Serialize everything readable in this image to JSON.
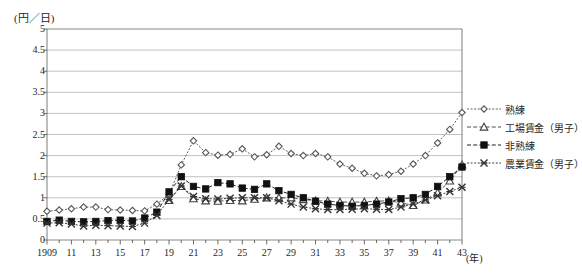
{
  "chart_data": {
    "type": "line",
    "title": "",
    "subtitle": "",
    "ylabel": "(円／日)",
    "xlabel": "(年)",
    "ylim": [
      0,
      5
    ],
    "ytick_step": 0.5,
    "yticks": [
      "0",
      "0.5",
      "1",
      "1.5",
      "2",
      "2.5",
      "3",
      "3.5",
      "4",
      "4.5",
      "5"
    ],
    "xlim": [
      1909,
      1943
    ],
    "xticks": [
      "1909",
      "11",
      "13",
      "15",
      "17",
      "19",
      "21",
      "23",
      "25",
      "27",
      "29",
      "31",
      "33",
      "35",
      "37",
      "39",
      "41",
      "43"
    ],
    "x": [
      1909,
      1910,
      1911,
      1912,
      1913,
      1914,
      1915,
      1916,
      1917,
      1918,
      1919,
      1920,
      1921,
      1922,
      1923,
      1924,
      1925,
      1926,
      1927,
      1928,
      1929,
      1930,
      1931,
      1932,
      1933,
      1934,
      1935,
      1936,
      1937,
      1938,
      1939,
      1940,
      1941,
      1942,
      1943
    ],
    "grid": true,
    "legend_position": "right",
    "series": [
      {
        "name": "熟練",
        "marker": "diamond",
        "linestyle": "dotted",
        "color": "#555555",
        "values": [
          0.68,
          0.71,
          0.74,
          0.78,
          0.78,
          0.72,
          0.71,
          0.7,
          0.69,
          0.85,
          1.08,
          1.78,
          2.35,
          2.07,
          2.01,
          2.03,
          2.16,
          1.97,
          2.02,
          2.22,
          2.05,
          2.0,
          2.05,
          1.97,
          1.8,
          1.7,
          1.58,
          1.52,
          1.55,
          1.63,
          1.8,
          2.0,
          2.3,
          2.62,
          3.02
        ]
      },
      {
        "name": "工場賃金（男子）",
        "marker": "triangle",
        "linestyle": "dashed",
        "color": "#444444",
        "values": [
          null,
          null,
          null,
          null,
          null,
          null,
          null,
          null,
          null,
          null,
          0.94,
          1.27,
          0.98,
          0.93,
          0.92,
          0.94,
          0.93,
          0.97,
          1.0,
          1.0,
          1.0,
          0.96,
          0.93,
          0.92,
          0.9,
          0.9,
          0.9,
          0.92,
          0.93,
          0.88,
          0.82,
          0.95,
          1.12,
          1.4,
          1.78
        ]
      },
      {
        "name": "非熟練",
        "marker": "square",
        "linestyle": "dashed",
        "color": "#111111",
        "values": [
          0.44,
          0.47,
          0.44,
          0.43,
          0.44,
          0.46,
          0.47,
          0.45,
          0.52,
          0.66,
          1.14,
          1.5,
          1.27,
          1.21,
          1.36,
          1.33,
          1.23,
          1.2,
          1.33,
          1.17,
          1.08,
          1.0,
          0.92,
          0.85,
          0.82,
          0.8,
          0.82,
          0.85,
          0.9,
          0.98,
          1.0,
          1.08,
          1.27,
          1.5,
          1.73
        ]
      },
      {
        "name": "農業賃金（男子）",
        "marker": "x",
        "linestyle": "dotted",
        "color": "#333333",
        "values": [
          0.4,
          0.41,
          0.38,
          0.33,
          0.35,
          0.34,
          0.33,
          0.32,
          0.4,
          0.58,
          0.96,
          1.28,
          1.03,
          0.98,
          0.97,
          0.99,
          1.0,
          1.0,
          1.0,
          0.93,
          0.85,
          0.78,
          0.74,
          0.72,
          0.72,
          0.73,
          0.74,
          0.73,
          0.72,
          0.78,
          0.85,
          0.95,
          1.05,
          1.15,
          1.25
        ]
      }
    ]
  },
  "legend": {
    "items": [
      {
        "label": "熟練"
      },
      {
        "label": "工場賃金（男子）"
      },
      {
        "label": "非熟練"
      },
      {
        "label": "農業賃金（男子）"
      }
    ]
  }
}
